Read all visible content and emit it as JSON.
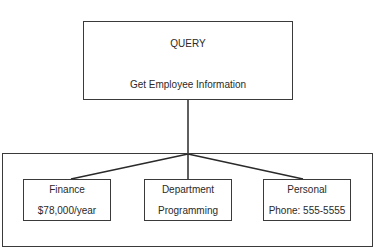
{
  "query": {
    "title": "QUERY",
    "subtitle": "Get Employee Information"
  },
  "results": [
    {
      "title": "Finance",
      "value": "$78,000/year"
    },
    {
      "title": "Department",
      "value": "Programming"
    },
    {
      "title": "Personal",
      "value": "Phone: 555-5555"
    }
  ],
  "colors": {
    "line": "#2a2a2a",
    "background": "#ffffff"
  }
}
